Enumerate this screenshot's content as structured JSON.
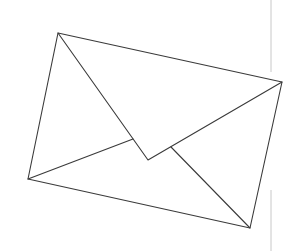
{
  "image": {
    "subject": "envelope-line-drawing",
    "width": 297,
    "height": 251,
    "background": "#ffffff"
  },
  "envelope": {
    "stroke_color": "#3a3a3a",
    "stroke_width": 1.1,
    "outline": [
      [
        58,
        33
      ],
      [
        282,
        82
      ],
      [
        250,
        228
      ],
      [
        28,
        179
      ]
    ],
    "flap": [
      [
        58,
        33
      ],
      [
        148,
        160
      ],
      [
        282,
        82
      ]
    ],
    "inner_left_fold": [
      [
        28,
        179
      ],
      [
        133,
        139
      ]
    ],
    "inner_right_fold": [
      [
        171,
        147
      ],
      [
        250,
        228
      ]
    ]
  },
  "divider_line": {
    "color": "#c8c8c8",
    "x": 271,
    "segments": [
      [
        0,
        72
      ],
      [
        190,
        251
      ]
    ]
  }
}
